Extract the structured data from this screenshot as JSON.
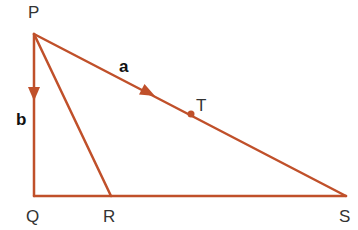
{
  "diagram": {
    "stroke_color": "#c0502a",
    "points": {
      "P": {
        "label": "P",
        "x": 34,
        "y": 34
      },
      "Q": {
        "label": "Q",
        "x": 34,
        "y": 196
      },
      "R": {
        "label": "R",
        "x": 111,
        "y": 196
      },
      "S": {
        "label": "S",
        "x": 346,
        "y": 196
      },
      "T": {
        "label": "T",
        "x": 191,
        "y": 114
      }
    },
    "segments": [
      "PQ",
      "QS",
      "PS",
      "PR"
    ],
    "vectors": {
      "a": {
        "label": "a",
        "from": "P",
        "to": "S",
        "arrow_at": [
          145,
          91
        ]
      },
      "b": {
        "label": "b",
        "from": "P",
        "to": "Q",
        "arrow_at": [
          34,
          92
        ]
      }
    }
  }
}
